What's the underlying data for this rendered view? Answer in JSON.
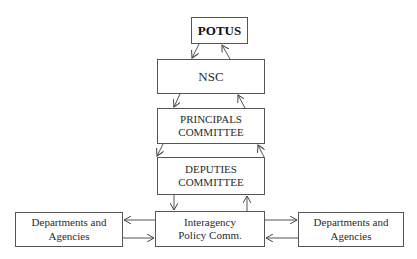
{
  "diagram": {
    "title": "",
    "nodes": {
      "potus": {
        "label": "POTUS"
      },
      "nsc": {
        "label": "NSC"
      },
      "principals": {
        "line1": "PRINCIPALS",
        "line2": "COMMITTEE"
      },
      "deputies": {
        "line1": "DEPUTIES",
        "line2": "COMMITTEE"
      },
      "interagency": {
        "line1": "Interagency",
        "line2": "Policy Comm."
      },
      "dept_left": {
        "line1": "Departments and",
        "line2": "Agencies"
      },
      "dept_right": {
        "line1": "Departments and",
        "line2": "Agencies"
      }
    },
    "edges": [
      {
        "from": "POTUS",
        "to": "NSC"
      },
      {
        "from": "NSC",
        "to": "POTUS"
      },
      {
        "from": "NSC",
        "to": "PRINCIPALS COMMITTEE"
      },
      {
        "from": "PRINCIPALS COMMITTEE",
        "to": "NSC"
      },
      {
        "from": "PRINCIPALS COMMITTEE",
        "to": "DEPUTIES COMMITTEE"
      },
      {
        "from": "DEPUTIES COMMITTEE",
        "to": "PRINCIPALS COMMITTEE"
      },
      {
        "from": "DEPUTIES COMMITTEE",
        "to": "Interagency Policy Comm."
      },
      {
        "from": "Interagency Policy Comm.",
        "to": "DEPUTIES COMMITTEE"
      },
      {
        "from": "Interagency Policy Comm.",
        "to": "Departments and Agencies (left)"
      },
      {
        "from": "Departments and Agencies (left)",
        "to": "Interagency Policy Comm."
      },
      {
        "from": "Interagency Policy Comm.",
        "to": "Departments and Agencies (right)"
      },
      {
        "from": "Departments and Agencies (right)",
        "to": "Interagency Policy Comm."
      }
    ],
    "colors": {
      "line": "#555555",
      "text": "#2a2a2a",
      "background": "#ffffff"
    }
  }
}
